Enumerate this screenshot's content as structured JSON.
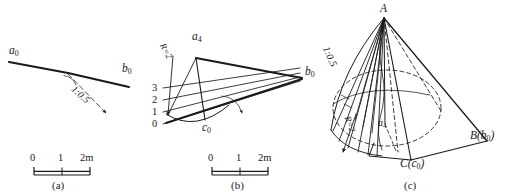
{
  "figure": {
    "stroke_color": "#1a1a1a",
    "background": "#ffffff"
  },
  "panels": [
    {
      "id": "a",
      "caption": "(a)",
      "labels": {
        "point_a": "a",
        "point_a_sub": "0",
        "point_b": "b",
        "point_b_sub": "0",
        "slope_ratio": "1:0.5"
      },
      "scale": {
        "ticks": [
          "0",
          "1",
          "2m"
        ]
      }
    },
    {
      "id": "b",
      "caption": "(b)",
      "labels": {
        "point_a4": "a",
        "point_a4_sub": "4",
        "point_b": "b",
        "point_b_sub": "0",
        "point_c": "c",
        "point_c_sub": "0",
        "radius": "R=2"
      },
      "contour_levels": [
        "3",
        "2",
        "1",
        "0"
      ],
      "scale": {
        "ticks": [
          "0",
          "1",
          "2m"
        ]
      }
    },
    {
      "id": "c",
      "caption": "(c)",
      "labels": {
        "apex": "A",
        "point_B": "B(b",
        "point_B_sub": "0",
        "point_B_end": ")",
        "point_C": "C(c",
        "point_C_sub": "0",
        "point_C_end": ")",
        "point_a4": "a",
        "point_a4_sub": "4",
        "slope_ratio": "1:0.5",
        "radius": "R=2"
      }
    }
  ]
}
